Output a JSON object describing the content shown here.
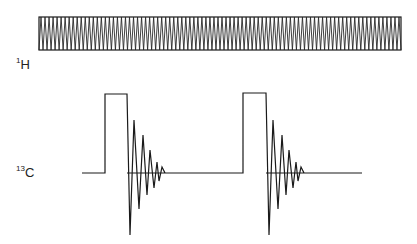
{
  "diagram": {
    "title": "",
    "channels": [
      {
        "id": "1H",
        "label_mass": "1",
        "label_element": "H",
        "description": "Continuous decoupling (zig-zag band)",
        "box": {
          "x": 39,
          "y": 17,
          "width": 362,
          "height": 33
        },
        "cycles": 90
      },
      {
        "id": "13C",
        "label_mass": "13",
        "label_element": "C",
        "description": "Pulse followed by free induction decay, repeated twice",
        "baseline_y": 173,
        "baseline_start_x": 82,
        "baseline_end_x": 362,
        "pulses": [
          {
            "start_x": 105,
            "end_x": 127,
            "top_y": 94
          },
          {
            "start_x": 243,
            "end_x": 266,
            "top_y": 93
          }
        ],
        "fid_offsets": [
          [
            0,
            0
          ],
          [
            3,
            62
          ],
          [
            7,
            -53
          ],
          [
            12,
            36
          ],
          [
            16,
            -38
          ],
          [
            20,
            22
          ],
          [
            23,
            -23
          ],
          [
            27,
            15
          ],
          [
            30,
            -11
          ],
          [
            32,
            8
          ],
          [
            35,
            -6
          ],
          [
            38,
            0
          ]
        ]
      }
    ],
    "colors": {
      "line": "#1a1a1a",
      "background": "#ffffff"
    }
  }
}
